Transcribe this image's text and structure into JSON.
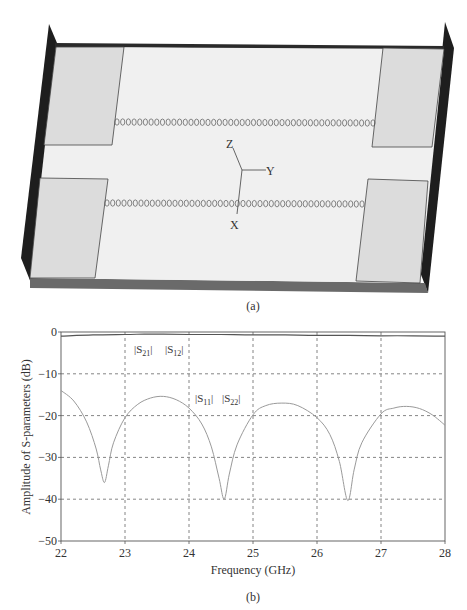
{
  "figure_a": {
    "caption": "(a)",
    "axis_labels": {
      "x": "X",
      "y": "Y",
      "z": "Z"
    },
    "via_rows": 2,
    "vias_per_row": 46,
    "colors": {
      "substrate_top": "#f0f0f0",
      "pad": "#dcdcdc",
      "edge_dark": "#1e1e1e",
      "edge_bottom": "#6a6a6a",
      "outline": "#444444"
    }
  },
  "figure_b": {
    "caption": "(b)",
    "annotations": {
      "transmission": [
        "|S21|",
        "|S12|"
      ],
      "reflection": [
        "|S11|",
        "|S22|"
      ]
    }
  },
  "chart_data": {
    "type": "line",
    "title": "",
    "xlabel": "Frequency (GHz)",
    "ylabel": "Amplitude of S-parameters (dB)",
    "xlim": [
      22,
      28
    ],
    "ylim": [
      -50,
      0
    ],
    "xticks": [
      22,
      23,
      24,
      25,
      26,
      27,
      28
    ],
    "yticks": [
      0,
      -10,
      -20,
      -30,
      -40,
      -50
    ],
    "ytick_labels": [
      "0",
      "−10",
      "−20",
      "−30",
      "−40",
      "−50"
    ],
    "grid": true,
    "grid_style": "dashed",
    "legend": "none (inline annotations)",
    "series": [
      {
        "name": "|S21| |S12|",
        "x": [
          22.0,
          22.5,
          23.0,
          23.3,
          23.6,
          24.0,
          24.5,
          25.0,
          25.5,
          26.0,
          26.5,
          27.0,
          27.5,
          28.0
        ],
        "y": [
          -1.0,
          -0.7,
          -0.6,
          -0.5,
          -0.5,
          -0.6,
          -0.6,
          -0.7,
          -0.7,
          -0.8,
          -0.8,
          -0.9,
          -0.9,
          -1.0
        ]
      },
      {
        "name": "|S11| |S22|",
        "x": [
          22.0,
          22.2,
          22.4,
          22.55,
          22.62,
          22.68,
          22.74,
          22.82,
          23.0,
          23.2,
          23.4,
          23.6,
          23.8,
          24.0,
          24.2,
          24.35,
          24.47,
          24.55,
          24.63,
          24.75,
          25.0,
          25.2,
          25.45,
          25.7,
          26.0,
          26.2,
          26.35,
          26.48,
          26.58,
          26.7,
          27.0,
          27.2,
          27.4,
          27.6,
          27.8,
          28.0
        ],
        "y": [
          -14.0,
          -16.5,
          -21.5,
          -28.0,
          -33.0,
          -36.0,
          -32.0,
          -26.5,
          -20.5,
          -17.3,
          -15.8,
          -15.4,
          -16.2,
          -18.2,
          -22.0,
          -27.5,
          -35.0,
          -40.0,
          -34.0,
          -27.0,
          -19.8,
          -17.6,
          -17.0,
          -17.6,
          -20.5,
          -24.5,
          -31.0,
          -40.3,
          -33.0,
          -26.5,
          -19.6,
          -18.2,
          -17.8,
          -18.3,
          -19.8,
          -22.3
        ]
      }
    ]
  }
}
